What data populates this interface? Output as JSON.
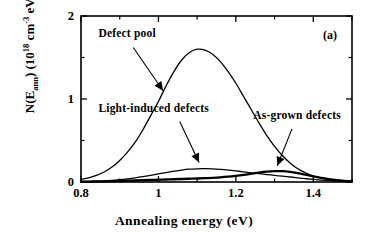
{
  "figure": {
    "panel_label": "(a)",
    "x_axis_title": "Annealing energy   (eV)",
    "y_axis_title_parts": {
      "prefix": "N(E",
      "sub1": "ann",
      "mid": ")  (10",
      "sup1": "18",
      "mid2": " cm",
      "sup2": "-3",
      "mid3": " eV",
      "sup3": "-1",
      "suffix": ")"
    },
    "y_axis_title_plain": "N(Eann) (10^18 cm^-3 eV^-1)",
    "x_tick_labels": [
      "0.8",
      "1",
      "1.2",
      "1.4"
    ],
    "y_tick_labels": [
      "0",
      "1",
      "2"
    ],
    "labels": {
      "defect_pool": "Defect  pool",
      "light_induced": "Light-induced  defects",
      "as_grown": "As-grown  defects"
    },
    "colors": {
      "axis": "#000000",
      "curve": "#000000",
      "background": "#ffffff"
    }
  },
  "chart_data": {
    "type": "line",
    "title": "",
    "subtitle": "",
    "xlabel": "Annealing energy (eV)",
    "ylabel": "N(Eann) (10^18 cm^-3 eV^-1)",
    "xlim": [
      0.8,
      1.5
    ],
    "ylim": [
      0,
      2
    ],
    "xticks": [
      0.8,
      1.0,
      1.2,
      1.4
    ],
    "xticks_minor": [
      0.9,
      1.1,
      1.3,
      1.5
    ],
    "yticks": [
      0,
      1,
      2
    ],
    "yticks_minor": [
      0.5,
      1.5
    ],
    "grid": false,
    "legend": "annotations",
    "annotations": [
      {
        "text": "Defect  pool",
        "x": 0.88,
        "y": 1.72,
        "arrow_to_x": 1.01,
        "arrow_to_y": 1.07
      },
      {
        "text": "Light-induced  defects",
        "x": 0.89,
        "y": 0.82,
        "arrow_to_x": 1.1,
        "arrow_to_y": 0.22
      },
      {
        "text": "As-grown  defects",
        "x": 1.26,
        "y": 0.72,
        "arrow_to_x": 1.305,
        "arrow_to_y": 0.17
      },
      {
        "text": "(a)",
        "x": 1.43,
        "y": 1.82
      }
    ],
    "series": [
      {
        "name": "Defect pool",
        "peak_x": 1.09,
        "peak_y": 1.6,
        "x": [
          0.8,
          0.82,
          0.84,
          0.86,
          0.88,
          0.9,
          0.92,
          0.94,
          0.96,
          0.98,
          1.0,
          1.02,
          1.04,
          1.06,
          1.08,
          1.1,
          1.12,
          1.14,
          1.16,
          1.18,
          1.2,
          1.22,
          1.24,
          1.26,
          1.28,
          1.3,
          1.32,
          1.34,
          1.36,
          1.38,
          1.4,
          1.42,
          1.44,
          1.46,
          1.48,
          1.5
        ],
        "values": [
          0.03,
          0.05,
          0.08,
          0.12,
          0.18,
          0.26,
          0.36,
          0.48,
          0.63,
          0.8,
          0.97,
          1.16,
          1.33,
          1.47,
          1.56,
          1.6,
          1.59,
          1.54,
          1.45,
          1.33,
          1.19,
          1.03,
          0.87,
          0.71,
          0.56,
          0.43,
          0.32,
          0.23,
          0.16,
          0.11,
          0.07,
          0.05,
          0.03,
          0.02,
          0.01,
          0.01
        ]
      },
      {
        "name": "Light-induced defects",
        "peak_x": 1.08,
        "peak_y": 0.16,
        "x": [
          0.8,
          0.82,
          0.84,
          0.86,
          0.88,
          0.9,
          0.92,
          0.94,
          0.96,
          0.98,
          1.0,
          1.02,
          1.04,
          1.06,
          1.08,
          1.1,
          1.12,
          1.14,
          1.16,
          1.18,
          1.2,
          1.22,
          1.24,
          1.26,
          1.28,
          1.3,
          1.32,
          1.34,
          1.36,
          1.38,
          1.4,
          1.42,
          1.44,
          1.46,
          1.48,
          1.5
        ],
        "values": [
          0.005,
          0.007,
          0.01,
          0.014,
          0.02,
          0.028,
          0.038,
          0.05,
          0.064,
          0.08,
          0.097,
          0.114,
          0.13,
          0.144,
          0.154,
          0.159,
          0.16,
          0.157,
          0.151,
          0.143,
          0.133,
          0.122,
          0.111,
          0.1,
          0.09,
          0.08,
          0.07,
          0.06,
          0.05,
          0.04,
          0.031,
          0.023,
          0.016,
          0.011,
          0.007,
          0.005
        ]
      },
      {
        "name": "As-grown defects",
        "peak_x": 1.3,
        "peak_y": 0.13,
        "x": [
          0.8,
          0.82,
          0.84,
          0.86,
          0.88,
          0.9,
          0.92,
          0.94,
          0.96,
          0.98,
          1.0,
          1.02,
          1.04,
          1.06,
          1.08,
          1.1,
          1.12,
          1.14,
          1.16,
          1.18,
          1.2,
          1.22,
          1.24,
          1.26,
          1.28,
          1.3,
          1.32,
          1.34,
          1.36,
          1.38,
          1.4,
          1.42,
          1.44,
          1.46,
          1.48,
          1.5
        ],
        "values": [
          0.004,
          0.005,
          0.006,
          0.008,
          0.01,
          0.012,
          0.015,
          0.018,
          0.021,
          0.024,
          0.027,
          0.03,
          0.033,
          0.036,
          0.039,
          0.042,
          0.046,
          0.05,
          0.056,
          0.064,
          0.074,
          0.086,
          0.1,
          0.114,
          0.125,
          0.131,
          0.13,
          0.122,
          0.107,
          0.088,
          0.068,
          0.049,
          0.034,
          0.022,
          0.014,
          0.009
        ]
      }
    ]
  }
}
